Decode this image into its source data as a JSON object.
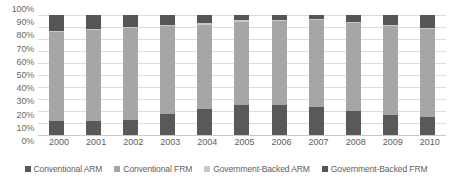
{
  "chart_data": {
    "type": "bar",
    "subtype": "100% stacked bar",
    "title": "",
    "xlabel": "",
    "ylabel": "",
    "ylim": [
      0,
      100
    ],
    "grid": "horizontal",
    "legend_position": "bottom",
    "categories": [
      "2000",
      "2001",
      "2002",
      "2003",
      "2004",
      "2005",
      "2006",
      "2007",
      "2008",
      "2009",
      "2010"
    ],
    "y_ticks": [
      "0%",
      "10%",
      "20%",
      "30%",
      "40%",
      "50%",
      "60%",
      "70%",
      "80%",
      "90%",
      "100%"
    ],
    "y_tick_values": [
      0,
      10,
      20,
      30,
      40,
      50,
      60,
      70,
      80,
      90,
      100
    ],
    "series": [
      {
        "name": "Conventional ARM",
        "color": "#595959",
        "values": [
          12,
          12,
          12.5,
          17.5,
          22,
          25,
          25,
          23,
          20,
          16.5,
          15
        ]
      },
      {
        "name": "Conventional FRM",
        "color": "#a6a6a6",
        "values": [
          74,
          75.5,
          76.5,
          73.5,
          70,
          69.5,
          70,
          72.5,
          73,
          74.5,
          73
        ]
      },
      {
        "name": "Government-Backed ARM",
        "color": "#c9c9c9",
        "values": [
          1,
          1,
          1,
          1,
          1,
          1,
          1,
          1,
          1,
          1,
          1
        ]
      },
      {
        "name": "Government-Backed FRM",
        "color": "#555555",
        "values": [
          13,
          11.5,
          10,
          8,
          7,
          4.5,
          4,
          3.5,
          6,
          8,
          11
        ]
      }
    ]
  }
}
